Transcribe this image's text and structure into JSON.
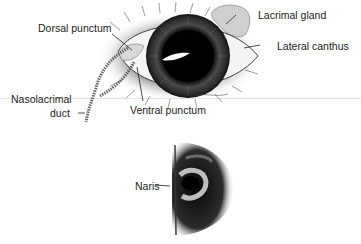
{
  "figure": {
    "top_panel": {
      "subject": "eye",
      "labels": {
        "dorsal_punctum": "Dorsal punctum",
        "lacrimal_gland": "Lacrimal gland",
        "lateral_canthus": "Lateral canthus",
        "nasolacrimal_duct_line1": "Nasolacrimal",
        "nasolacrimal_duct_line2": "duct",
        "ventral_punctum": "Ventral punctum"
      }
    },
    "bottom_panel": {
      "subject": "nose",
      "labels": {
        "naris": "Naris"
      }
    }
  }
}
